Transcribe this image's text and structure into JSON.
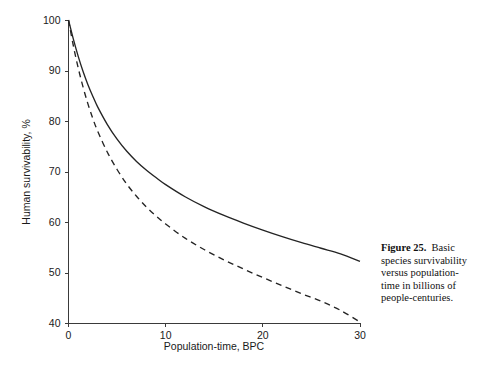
{
  "figure": {
    "caption_label": "Figure 25.",
    "caption_text": "Basic species survivability versus population-time in billions of people-centuries."
  },
  "chart_data": {
    "type": "line",
    "title": "",
    "xlabel": "Population-time, BPC",
    "ylabel": "Human survivability, %",
    "xlim": [
      0,
      30
    ],
    "ylim": [
      40,
      100
    ],
    "xticks": [
      0,
      10,
      20,
      30
    ],
    "yticks": [
      40,
      50,
      60,
      70,
      80,
      90,
      100
    ],
    "xtick_labels": [
      "0",
      "10",
      "20",
      "30"
    ],
    "ytick_labels": [
      "40",
      "50",
      "60",
      "70",
      "80",
      "90",
      "100"
    ],
    "grid": false,
    "legend": "none",
    "x": [
      0,
      0.5,
      1,
      1.5,
      2,
      2.5,
      3,
      4,
      5,
      6,
      7,
      8,
      9,
      10,
      12,
      14,
      16,
      18,
      20,
      22,
      24,
      26,
      28,
      30
    ],
    "series": [
      {
        "name": "solid",
        "style": "solid",
        "color": "#242424",
        "values": [
          100,
          96.2,
          92.8,
          89.8,
          87.2,
          84.9,
          82.8,
          79.3,
          76.4,
          74.0,
          72.0,
          70.3,
          68.8,
          67.4,
          65.0,
          63.0,
          61.3,
          59.8,
          58.4,
          57.1,
          55.9,
          54.8,
          53.7,
          52.2
        ]
      },
      {
        "name": "dashed",
        "style": "dashed",
        "color": "#242424",
        "values": [
          100,
          94.9,
          90.5,
          86.7,
          83.4,
          80.5,
          78.0,
          73.8,
          70.4,
          67.5,
          65.1,
          63.0,
          61.2,
          59.6,
          56.8,
          54.5,
          52.5,
          50.7,
          49.0,
          47.4,
          45.8,
          44.3,
          42.5,
          40.2
        ]
      }
    ]
  }
}
